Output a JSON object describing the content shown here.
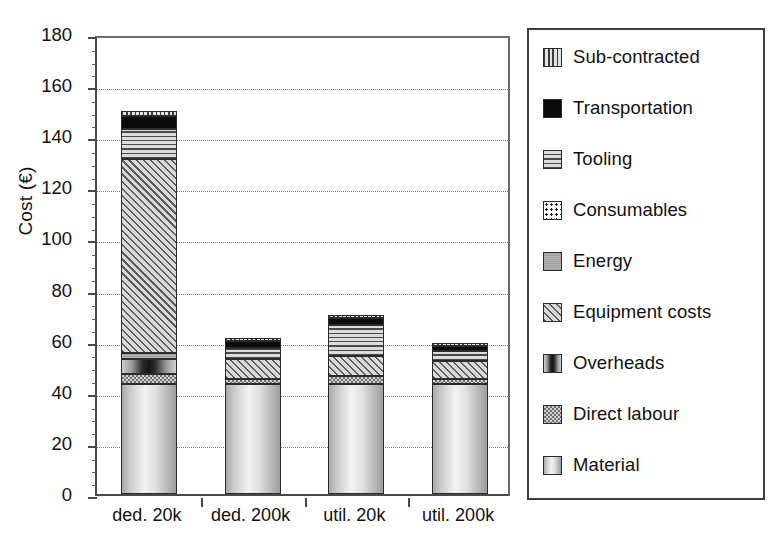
{
  "chart_data": {
    "type": "bar",
    "subtype": "stacked",
    "title": "",
    "xlabel": "",
    "ylabel": "Cost (€)",
    "ylim": [
      0,
      180
    ],
    "ytick_step": 20,
    "yminor_step": 5,
    "grid": "horizontal-dotted",
    "legend_position": "right",
    "categories": [
      "ded. 20k",
      "ded. 200k",
      "util. 20k",
      "util. 200k"
    ],
    "ytick_labels": [
      "0",
      "20",
      "40",
      "60",
      "80",
      "100",
      "120",
      "140",
      "160",
      "180"
    ],
    "series": [
      {
        "name": "Material",
        "pattern": "vertical-gradient-light",
        "values": [
          43,
          43,
          43,
          43
        ]
      },
      {
        "name": "Direct labour",
        "pattern": "fine-checker",
        "values": [
          4,
          2,
          3,
          2
        ]
      },
      {
        "name": "Overheads",
        "pattern": "vertical-bands-dark",
        "values": [
          6,
          0,
          0,
          0
        ]
      },
      {
        "name": "Energy",
        "pattern": "solid-grey",
        "values": [
          2,
          0,
          0,
          0
        ]
      },
      {
        "name": "Equipment costs",
        "pattern": "diagonal-hatch",
        "values": [
          76,
          8,
          8,
          7
        ]
      },
      {
        "name": "Consumables",
        "pattern": "dotted-white",
        "values": [
          0,
          0,
          0,
          0
        ]
      },
      {
        "name": "Tooling",
        "pattern": "horizontal-lines",
        "values": [
          12,
          4,
          12,
          4
        ]
      },
      {
        "name": "Transportation",
        "pattern": "solid-black",
        "values": [
          5,
          3,
          3,
          2
        ]
      },
      {
        "name": "Sub-contracted",
        "pattern": "vertical-lines",
        "values": [
          2,
          1,
          1,
          1
        ]
      }
    ],
    "totals": [
      150,
      61,
      70,
      59
    ]
  },
  "legend": {
    "items": [
      {
        "label": "Sub-contracted",
        "swatch": "vertical-lines-swatch"
      },
      {
        "label": "Transportation",
        "swatch": "solid-black-swatch"
      },
      {
        "label": "Tooling",
        "swatch": "horizontal-lines-swatch"
      },
      {
        "label": "Consumables",
        "swatch": "dotted-white-swatch"
      },
      {
        "label": "Energy",
        "swatch": "solid-grey-swatch"
      },
      {
        "label": "Equipment costs",
        "swatch": "diagonal-hatch-swatch"
      },
      {
        "label": "Overheads",
        "swatch": "vertical-bands-swatch"
      },
      {
        "label": "Direct labour",
        "swatch": "fine-checker-swatch"
      },
      {
        "label": "Material",
        "swatch": "light-gradient-swatch"
      }
    ]
  }
}
